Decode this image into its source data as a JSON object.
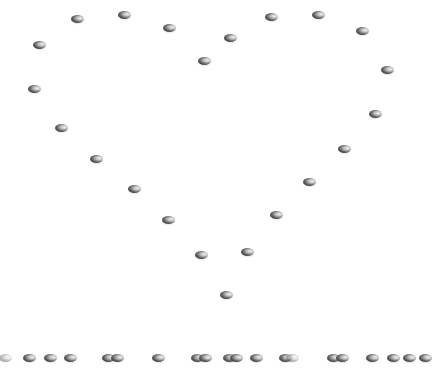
{
  "scene": {
    "description": "Heart shape outlined by shaded dots above a row of dots",
    "background_color": "#ffffff",
    "dot_color": "#3a3a3a",
    "heart_dot_count": 27,
    "row_dot_count": 20
  },
  "heart_dots": [
    [
      77,
      19
    ],
    [
      124,
      15
    ],
    [
      169,
      28
    ],
    [
      39,
      45
    ],
    [
      34,
      89
    ],
    [
      61,
      128
    ],
    [
      96,
      159
    ],
    [
      134,
      189
    ],
    [
      168,
      220
    ],
    [
      201,
      255
    ],
    [
      226,
      295
    ],
    [
      230,
      38
    ],
    [
      204,
      61
    ],
    [
      271,
      17
    ],
    [
      318,
      15
    ],
    [
      362,
      31
    ],
    [
      387,
      70
    ],
    [
      375,
      114
    ],
    [
      344,
      149
    ],
    [
      309,
      182
    ],
    [
      276,
      215
    ],
    [
      247,
      252
    ]
  ],
  "row_dots": [
    [
      5,
      358,
      "faint"
    ],
    [
      29,
      358
    ],
    [
      50,
      358
    ],
    [
      70,
      358
    ],
    [
      108,
      358
    ],
    [
      117,
      358
    ],
    [
      158,
      358
    ],
    [
      197,
      358
    ],
    [
      205,
      358
    ],
    [
      229,
      358
    ],
    [
      236,
      358
    ],
    [
      256,
      358
    ],
    [
      285,
      358
    ],
    [
      292,
      358,
      "faint"
    ],
    [
      333,
      358
    ],
    [
      342,
      358
    ],
    [
      372,
      358
    ],
    [
      393,
      358
    ],
    [
      409,
      358
    ],
    [
      425,
      358
    ]
  ]
}
